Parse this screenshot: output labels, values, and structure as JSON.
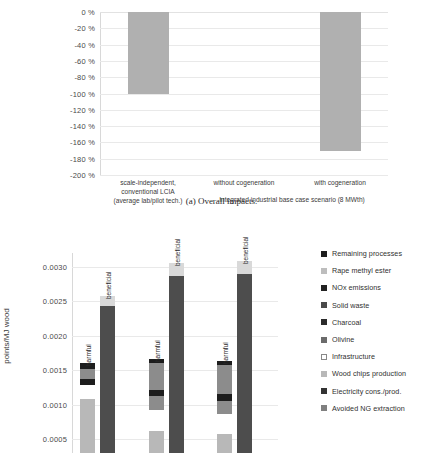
{
  "figure": {
    "caption_a": "(a) Overall impacts."
  },
  "chart_data": [
    {
      "id": "overall-impacts",
      "type": "bar",
      "title": "(a) Overall impacts.",
      "xlabel": "",
      "ylabel": "",
      "ylim": [
        -200,
        0
      ],
      "grid": true,
      "yticks": [
        "0 %",
        "-20 %",
        "-40 %",
        "-60 %",
        "-80 %",
        "-100 %",
        "-120 %",
        "-140 %",
        "-160 %",
        "-180 %",
        "-200 %"
      ],
      "ytick_values": [
        0,
        -20,
        -40,
        -60,
        -80,
        -100,
        -120,
        -140,
        -160,
        -180,
        -200
      ],
      "categories": [
        "scale-independent, conventional LCIA (average lab/pilot tech.)",
        "without cogeneration",
        "with cogeneration"
      ],
      "category_lines": [
        [
          "scale-independent,",
          "conventional LCIA",
          "(average lab/pilot tech.)"
        ],
        [
          "without cogeneration"
        ],
        [
          "with cogeneration"
        ]
      ],
      "group_label": "Integrated industrial base case scenario (8 MWth)",
      "values": [
        -100,
        0,
        -170
      ],
      "bar_color": "#b0b0b0",
      "grid_color": "#e9e9e9"
    },
    {
      "id": "contribution-analysis",
      "type": "bar",
      "subtype": "stacked-grouped",
      "ylabel": "points/MJ wood",
      "ylim": [
        0.0003,
        0.0032
      ],
      "grid": true,
      "yticks": [
        "0.0030",
        "0.0025",
        "0.0020",
        "0.0015",
        "0.0010",
        "0.0005"
      ],
      "ytick_values": [
        0.003,
        0.0025,
        0.002,
        0.0015,
        0.001,
        0.0005
      ],
      "bar_labels": [
        "harmful",
        "beneficial"
      ],
      "groups": [
        {
          "name": "group-1",
          "harmful": {
            "label": "harmful",
            "segments": [
              {
                "series": "Wood chips production",
                "color": "#b8b8b8",
                "from": 0.0003,
                "to": 0.00108
              },
              {
                "series": "Infrastructure",
                "color": "#ffffff",
                "from": 0.00108,
                "to": 0.00128
              },
              {
                "series": "Charcoal",
                "color": "#1d1d1d",
                "from": 0.00128,
                "to": 0.00138
              },
              {
                "series": "Olivine",
                "color": "#8c8c8c",
                "from": 0.00138,
                "to": 0.00152
              },
              {
                "series": "NOx emissions",
                "color": "#1d1d1d",
                "from": 0.00152,
                "to": 0.0016
              }
            ]
          },
          "beneficial": {
            "label": "beneficial",
            "segments": [
              {
                "series": "Avoided NG extraction",
                "color": "#4d4d4d",
                "from": 0.0003,
                "to": 0.00243
              },
              {
                "series": "Electricity cons./prod.",
                "color": "#d9d9d9",
                "from": 0.00243,
                "to": 0.00258
              }
            ]
          }
        },
        {
          "name": "group-2",
          "harmful": {
            "label": "harmful",
            "segments": [
              {
                "series": "Wood chips production",
                "color": "#b8b8b8",
                "from": 0.0003,
                "to": 0.00062
              },
              {
                "series": "Infrastructure",
                "color": "#ffffff",
                "from": 0.00062,
                "to": 0.00092
              },
              {
                "series": "Rape methyl ester",
                "color": "#8c8c8c",
                "from": 0.00092,
                "to": 0.00112
              },
              {
                "series": "Charcoal",
                "color": "#1d1d1d",
                "from": 0.00112,
                "to": 0.00122
              },
              {
                "series": "Olivine",
                "color": "#8c8c8c",
                "from": 0.00122,
                "to": 0.0016
              },
              {
                "series": "NOx emissions",
                "color": "#1d1d1d",
                "from": 0.0016,
                "to": 0.00166
              }
            ]
          },
          "beneficial": {
            "label": "beneficial",
            "segments": [
              {
                "series": "Avoided NG extraction",
                "color": "#4d4d4d",
                "from": 0.0003,
                "to": 0.00287
              },
              {
                "series": "Electricity cons./prod.",
                "color": "#d9d9d9",
                "from": 0.00287,
                "to": 0.00305
              }
            ]
          }
        },
        {
          "name": "group-3",
          "harmful": {
            "label": "harmful",
            "segments": [
              {
                "series": "Wood chips production",
                "color": "#b8b8b8",
                "from": 0.0003,
                "to": 0.00058
              },
              {
                "series": "Infrastructure",
                "color": "#ffffff",
                "from": 0.00058,
                "to": 0.00086
              },
              {
                "series": "Rape methyl ester",
                "color": "#8c8c8c",
                "from": 0.00086,
                "to": 0.00106
              },
              {
                "series": "Charcoal",
                "color": "#1d1d1d",
                "from": 0.00106,
                "to": 0.00116
              },
              {
                "series": "Olivine",
                "color": "#8c8c8c",
                "from": 0.00116,
                "to": 0.00158
              },
              {
                "series": "NOx emissions",
                "color": "#1d1d1d",
                "from": 0.00158,
                "to": 0.00163
              }
            ]
          },
          "beneficial": {
            "label": "beneficial",
            "segments": [
              {
                "series": "Avoided NG extraction",
                "color": "#4d4d4d",
                "from": 0.0003,
                "to": 0.0029
              },
              {
                "series": "Electricity cons./prod.",
                "color": "#d9d9d9",
                "from": 0.0029,
                "to": 0.00308
              }
            ]
          }
        }
      ],
      "legend": {
        "position": "right",
        "items": [
          {
            "label": "Remaining processes",
            "color": "#1d1d1d",
            "outline": false
          },
          {
            "label": "Rape methyl ester",
            "color": "#bdbdbd",
            "outline": false
          },
          {
            "label": "NOx emissions",
            "color": "#222222",
            "outline": false
          },
          {
            "label": "Solid waste",
            "color": "#4a4a4a",
            "outline": false
          },
          {
            "label": "Charcoal",
            "color": "#2b2b2b",
            "outline": false
          },
          {
            "label": "Olivine",
            "color": "#6b6b6b",
            "outline": false
          },
          {
            "label": "Infrastructure",
            "color": "#ffffff",
            "outline": true
          },
          {
            "label": "Wood chips production",
            "color": "#b8b8b8",
            "outline": false
          },
          {
            "label": "Electricity cons./prod.",
            "color": "#333333",
            "outline": false
          },
          {
            "label": "Avoided NG extraction",
            "color": "#808080",
            "outline": false
          }
        ]
      }
    }
  ]
}
